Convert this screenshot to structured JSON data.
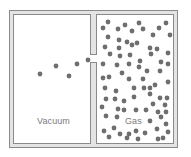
{
  "diagram": {
    "type": "gas-free-expansion",
    "colors": {
      "wall": "#8a8a8a",
      "wall_fill": "#e4e4e4",
      "chamber_fill": "#ffffff",
      "particle": "#6e6e6e",
      "label": "#7a7a7a"
    },
    "chambers": [
      {
        "name": "vacuum",
        "label": "Vacuum"
      },
      {
        "name": "gas",
        "label": "Gas"
      }
    ],
    "labels": {
      "vacuum": "Vacuum",
      "gas": "Gas"
    },
    "particle_radius": 2.4,
    "escaping_particles": [
      [
        40,
        74
      ],
      [
        56,
        66
      ],
      [
        69,
        76
      ],
      [
        77,
        64
      ],
      [
        88,
        60
      ]
    ],
    "gas_particles": [
      [
        108,
        22
      ],
      [
        103,
        28
      ],
      [
        118,
        29
      ],
      [
        125,
        25
      ],
      [
        132,
        31
      ],
      [
        139,
        23
      ],
      [
        143,
        29
      ],
      [
        153,
        35
      ],
      [
        159,
        28
      ],
      [
        166,
        23
      ],
      [
        170,
        35
      ],
      [
        108,
        37
      ],
      [
        119,
        40
      ],
      [
        127,
        42
      ],
      [
        137,
        43
      ],
      [
        105,
        47
      ],
      [
        119,
        48
      ],
      [
        132,
        45
      ],
      [
        150,
        48
      ],
      [
        157,
        49
      ],
      [
        168,
        53
      ],
      [
        110,
        54
      ],
      [
        120,
        56
      ],
      [
        130,
        55
      ],
      [
        140,
        61
      ],
      [
        151,
        54
      ],
      [
        161,
        62
      ],
      [
        103,
        64
      ],
      [
        117,
        65
      ],
      [
        129,
        64
      ],
      [
        139,
        67
      ],
      [
        147,
        71
      ],
      [
        160,
        71
      ],
      [
        168,
        64
      ],
      [
        103,
        78
      ],
      [
        109,
        77
      ],
      [
        122,
        73
      ],
      [
        129,
        79
      ],
      [
        143,
        79
      ],
      [
        150,
        88
      ],
      [
        155,
        85
      ],
      [
        168,
        82
      ],
      [
        105,
        88
      ],
      [
        116,
        91
      ],
      [
        134,
        88
      ],
      [
        144,
        88
      ],
      [
        106,
        99
      ],
      [
        115,
        99
      ],
      [
        124,
        101
      ],
      [
        134,
        97
      ],
      [
        150,
        94
      ],
      [
        160,
        98
      ],
      [
        167,
        98
      ],
      [
        153,
        104
      ],
      [
        165,
        105
      ],
      [
        102,
        107
      ],
      [
        118,
        109
      ],
      [
        124,
        110
      ],
      [
        136,
        110
      ],
      [
        146,
        110
      ],
      [
        158,
        112
      ],
      [
        166,
        112
      ],
      [
        106,
        116
      ],
      [
        117,
        117
      ],
      [
        150,
        121
      ],
      [
        161,
        117
      ],
      [
        166,
        124
      ],
      [
        104,
        131
      ],
      [
        114,
        128
      ],
      [
        120,
        134
      ],
      [
        129,
        134
      ],
      [
        136,
        131
      ],
      [
        145,
        133
      ],
      [
        157,
        129
      ],
      [
        168,
        132
      ],
      [
        109,
        137
      ],
      [
        127,
        138
      ],
      [
        138,
        139
      ],
      [
        158,
        139
      ],
      [
        163,
        138
      ]
    ]
  }
}
